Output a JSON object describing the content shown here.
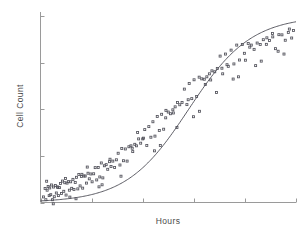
{
  "chart_data": {
    "type": "scatter",
    "title": "",
    "subtitle": "",
    "xlabel": "Hours",
    "ylabel": "Cell Count",
    "xlim": [
      0,
      100
    ],
    "ylim": [
      0,
      100
    ],
    "grid": false,
    "legend": null,
    "legend_position": "none",
    "x_tick_labels": [
      "",
      "",
      "",
      "",
      "",
      ""
    ],
    "y_tick_labels": [
      "",
      "",
      "",
      "",
      ""
    ],
    "x_tick_values": [
      0,
      20,
      40,
      60,
      80,
      100
    ],
    "y_tick_values": [
      0,
      25,
      50,
      75,
      100
    ],
    "marker": "open-square",
    "marker_color": "#53535c",
    "curve_color": "#4a4a52",
    "axis_color": "#9a9a9a",
    "series": [
      {
        "name": "observations",
        "type": "scatter",
        "x": [
          1.2,
          1.8,
          2.1,
          2.6,
          3.0,
          3.4,
          3.6,
          4.0,
          4.3,
          4.7,
          5.1,
          5.4,
          5.8,
          6.2,
          6.6,
          7.0,
          7.4,
          7.8,
          8.2,
          8.6,
          9.1,
          9.5,
          10.0,
          10.4,
          10.9,
          11.3,
          11.8,
          12.2,
          12.7,
          13.1,
          13.6,
          14.1,
          14.6,
          15.0,
          15.5,
          16.0,
          16.5,
          17.0,
          17.5,
          18.0,
          18.6,
          19.1,
          19.7,
          20.2,
          20.8,
          21.4,
          22.0,
          22.6,
          23.2,
          23.8,
          24.4,
          25.0,
          25.7,
          26.3,
          27.0,
          27.6,
          28.3,
          29.0,
          29.7,
          30.4,
          31.1,
          31.8,
          32.5,
          33.2,
          33.9,
          34.6,
          35.4,
          36.1,
          36.9,
          37.6,
          38.4,
          39.2,
          40.0,
          40.8,
          41.6,
          42.4,
          43.2,
          44.0,
          44.8,
          45.7,
          46.5,
          47.4,
          48.2,
          49.1,
          50.0,
          50.9,
          51.8,
          52.7,
          53.6,
          54.5,
          55.4,
          56.3,
          57.3,
          58.2,
          59.2,
          60.1,
          61.1,
          62.1,
          63.1,
          64.1,
          65.1,
          66.1,
          67.1,
          68.2,
          69.2,
          70.3,
          71.3,
          72.4,
          73.5,
          74.6,
          75.7,
          76.8,
          77.9,
          79.0,
          80.2,
          81.3,
          82.5,
          83.6,
          84.8,
          86.0,
          87.2,
          88.4,
          89.6,
          90.8,
          92.0,
          93.3,
          94.5,
          95.8,
          97.0,
          98.3,
          2.4,
          5.0,
          9.8,
          13.9,
          18.3,
          22.9,
          27.2,
          31.5,
          35.9,
          40.3,
          44.6,
          49.0,
          53.4,
          57.8,
          62.2,
          66.6,
          71.0,
          75.4,
          79.8,
          84.2,
          88.6,
          93.0,
          97.4,
          6.8,
          11.5,
          16.2,
          24.1,
          38.0,
          46.9,
          52.0,
          59.9,
          64.5,
          68.9,
          73.0,
          77.5,
          81.9,
          86.4,
          90.9,
          95.3,
          99.0
        ],
        "y": [
          4.8,
          5.1,
          4.6,
          5.4,
          5.0,
          5.9,
          4.9,
          5.6,
          6.1,
          5.3,
          6.4,
          5.8,
          6.0,
          6.7,
          6.2,
          7.1,
          6.5,
          7.4,
          6.9,
          7.8,
          7.2,
          8.1,
          7.6,
          8.6,
          8.0,
          9.0,
          8.4,
          9.5,
          8.9,
          10.0,
          9.3,
          10.6,
          9.9,
          11.2,
          10.4,
          11.9,
          11.0,
          12.5,
          11.6,
          13.2,
          12.3,
          14.0,
          13.0,
          14.8,
          13.8,
          15.7,
          14.6,
          16.6,
          15.5,
          17.6,
          16.4,
          18.6,
          17.5,
          19.8,
          18.6,
          21.0,
          19.8,
          22.3,
          21.0,
          23.7,
          22.4,
          25.2,
          23.8,
          26.7,
          25.3,
          28.4,
          27.0,
          30.2,
          28.6,
          32.0,
          30.4,
          34.0,
          32.3,
          36.0,
          34.2,
          38.2,
          36.2,
          40.4,
          38.3,
          42.8,
          40.5,
          45.2,
          42.7,
          47.7,
          45.0,
          50.2,
          47.4,
          52.8,
          49.8,
          55.4,
          52.3,
          58.0,
          54.9,
          60.6,
          57.5,
          63.2,
          60.1,
          65.8,
          62.7,
          68.2,
          65.2,
          70.6,
          67.6,
          72.9,
          70.0,
          75.1,
          72.2,
          77.1,
          74.3,
          79.0,
          76.3,
          80.7,
          78.1,
          82.3,
          79.8,
          83.7,
          81.3,
          85.0,
          82.7,
          86.1,
          84.0,
          87.1,
          85.1,
          88.0,
          86.1,
          88.8,
          87.0,
          89.5,
          87.8,
          90.1,
          6.2,
          3.9,
          8.8,
          7.4,
          12.8,
          13.2,
          17.6,
          20.2,
          24.8,
          28.6,
          33.4,
          39.0,
          44.4,
          50.0,
          55.2,
          61.0,
          66.2,
          71.4,
          75.6,
          79.4,
          83.0,
          86.0,
          88.4,
          4.2,
          7.0,
          9.6,
          15.4,
          31.0,
          37.0,
          43.0,
          51.5,
          57.2,
          63.4,
          69.0,
          73.2,
          77.0,
          80.5,
          83.4,
          85.8,
          88.2
        ],
        "jitter": [
          -1.8,
          2.4,
          -3.1,
          1.2,
          3.6,
          -2.2,
          2.9,
          -1.4,
          3.3,
          -3.8,
          1.9,
          -2.7,
          3.1,
          -1.6,
          2.2,
          -3.4,
          1.5,
          2.8,
          -2.1,
          3.7,
          -1.2,
          2.5,
          -3.6,
          1.8,
          3.2,
          -2.4,
          2.7,
          -1.9,
          3.5,
          -3.0,
          1.4,
          2.9,
          -2.6,
          3.8,
          -1.5,
          2.1,
          -3.3,
          1.7,
          2.6,
          -2.8,
          3.4,
          -1.3,
          2.3,
          -3.7,
          1.6,
          3.0,
          -2.5,
          2.2,
          -1.8,
          3.6,
          -3.2,
          1.1,
          2.8,
          -2.0,
          3.3,
          -1.7,
          2.4,
          -3.5,
          1.9,
          2.7,
          -2.3,
          3.8,
          -1.4,
          2.0,
          -3.1,
          1.5,
          3.4,
          -2.9,
          2.6,
          -1.6,
          3.7,
          -2.2,
          1.8,
          3.1,
          -3.6,
          2.5,
          -1.2,
          2.9,
          -2.7,
          3.3,
          -1.9,
          2.1,
          -3.4,
          1.7,
          3.5,
          -2.6,
          2.3,
          -1.5,
          3.8,
          -3.0,
          1.3,
          2.8,
          -2.4,
          3.2,
          -1.8,
          2.6,
          -3.3,
          1.4,
          3.6,
          -2.1,
          2.2,
          -1.6,
          3.0,
          -2.8,
          1.9,
          3.4,
          -3.2,
          2.5,
          -1.3,
          2.7,
          -2.0,
          3.7,
          -1.7,
          2.4,
          -3.5,
          1.6,
          3.1,
          -2.9,
          2.8,
          -1.4,
          3.3,
          -2.3,
          1.8,
          2.6,
          -3.6,
          1.2,
          2.9,
          -2.5,
          3.4,
          -1.9,
          5.2,
          -4.6,
          4.1,
          -5.4,
          6.2,
          -4.8,
          5.6,
          -6.1,
          4.3,
          5.9,
          -5.7,
          6.4,
          -4.2,
          5.1,
          -6.3,
          4.7,
          5.8,
          -5.2,
          4.4,
          -6.0,
          5.3,
          -4.9,
          4.6,
          3.8,
          -4.1,
          5.5,
          -5.9,
          6.5,
          -6.4,
          5.0,
          -5.5,
          6.1,
          -4.4,
          4.9,
          -5.8,
          6.3,
          -4.7,
          5.4,
          -6.2,
          4.0
        ]
      },
      {
        "name": "fitted-logistic-curve",
        "type": "line",
        "curve_model": "logistic",
        "L": 100,
        "k": 0.082,
        "x0": 58,
        "x_start": 0,
        "x_end": 100
      }
    ]
  },
  "axes": {
    "x_axis_label": "Hours",
    "y_axis_label": "Cell Count"
  }
}
